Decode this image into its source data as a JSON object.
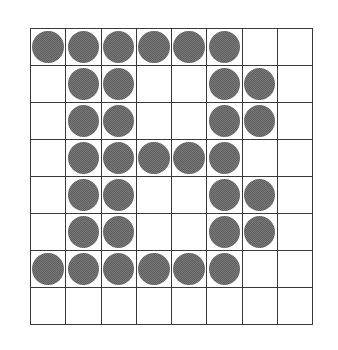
{
  "figure": {
    "type": "dot-matrix-grid",
    "rows": 8,
    "cols": 8,
    "depicts": "letter B",
    "colors": {
      "dot": "#7a7a7a",
      "dot_texture": "#5e5e5e",
      "grid_line": "#3a3a3a",
      "background": "#ffffff"
    },
    "matrix": [
      [
        1,
        1,
        1,
        1,
        1,
        1,
        0,
        0
      ],
      [
        0,
        1,
        1,
        0,
        0,
        1,
        1,
        0
      ],
      [
        0,
        1,
        1,
        0,
        0,
        1,
        1,
        0
      ],
      [
        0,
        1,
        1,
        1,
        1,
        1,
        0,
        0
      ],
      [
        0,
        1,
        1,
        0,
        0,
        1,
        1,
        0
      ],
      [
        0,
        1,
        1,
        0,
        0,
        1,
        1,
        0
      ],
      [
        1,
        1,
        1,
        1,
        1,
        1,
        0,
        0
      ],
      [
        0,
        0,
        0,
        0,
        0,
        0,
        0,
        0
      ]
    ]
  }
}
